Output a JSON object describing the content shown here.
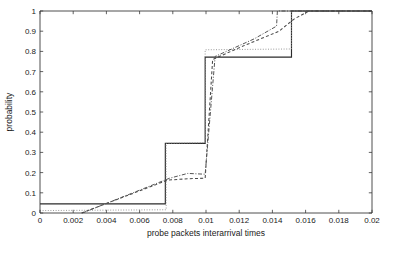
{
  "figure": {
    "background_color": "#ffffff",
    "plot_box": {
      "left": 40,
      "top": 11,
      "right": 372,
      "bottom": 213
    }
  },
  "chart_data": {
    "type": "line",
    "title": "",
    "subtitle": "",
    "xlabel": "probe packets interarrival times",
    "ylabel": "probability",
    "xlim": [
      0,
      0.02
    ],
    "ylim": [
      0,
      1
    ],
    "grid": false,
    "legend_position": "none",
    "xticks": [
      0,
      0.002,
      0.004,
      0.006,
      0.008,
      0.01,
      0.012,
      0.014,
      0.016,
      0.018,
      0.02
    ],
    "xticklabels": [
      "0",
      "0.002",
      "0.004",
      "0.006",
      "0.008",
      "0.01",
      "0.012",
      "0.014",
      "0.016",
      "0.018",
      "0.02"
    ],
    "yticks": [
      0,
      0.1,
      0.2,
      0.3,
      0.4,
      0.5,
      0.6,
      0.7,
      0.8,
      0.9,
      1
    ],
    "yticklabels": [
      "0",
      "0.1",
      "0.2",
      "0.3",
      "0.4",
      "0.5",
      "0.6",
      "0.7",
      "0.8",
      "0.9",
      "1"
    ],
    "series": [
      {
        "name": "empirical-cdf-solid",
        "style": "solid",
        "color": "#2b2b2b",
        "width": 1.15,
        "dasharray": "",
        "points": [
          [
            0.0,
            0.045
          ],
          [
            0.00755,
            0.045
          ],
          [
            0.00755,
            0.345
          ],
          [
            0.00995,
            0.345
          ],
          [
            0.00995,
            0.772
          ],
          [
            0.01515,
            0.772
          ],
          [
            0.01515,
            1.0
          ],
          [
            0.02,
            1.0
          ]
        ]
      },
      {
        "name": "model-cdf-dotted-light",
        "style": "dotted",
        "color": "#8f8f8f",
        "width": 0.9,
        "dasharray": "1,1.6",
        "points": [
          [
            0.0,
            0.012
          ],
          [
            0.0076,
            0.016
          ],
          [
            0.0076,
            0.345
          ],
          [
            0.00995,
            0.348
          ],
          [
            0.00995,
            0.808
          ],
          [
            0.01515,
            0.812
          ],
          [
            0.01515,
            1.0
          ],
          [
            0.02,
            1.0
          ]
        ]
      },
      {
        "name": "model-cdf-dashed",
        "style": "dashed",
        "color": "#4a4a4a",
        "width": 1.05,
        "dasharray": "3,2.2",
        "points": [
          [
            0.0025,
            0.0
          ],
          [
            0.0077,
            0.163
          ],
          [
            0.009,
            0.17
          ],
          [
            0.00995,
            0.172
          ],
          [
            0.0104,
            0.76
          ],
          [
            0.0121,
            0.822
          ],
          [
            0.0144,
            0.9
          ],
          [
            0.0153,
            0.96
          ],
          [
            0.0162,
            1.0
          ],
          [
            0.02,
            1.0
          ]
        ]
      },
      {
        "name": "model-cdf-dashdot",
        "style": "dashdot",
        "color": "#555555",
        "width": 1.0,
        "dasharray": "4,1.6,1,1.6",
        "points": [
          [
            0.00255,
            0.0
          ],
          [
            0.0078,
            0.172
          ],
          [
            0.0089,
            0.196
          ],
          [
            0.00995,
            0.192
          ],
          [
            0.01055,
            0.775
          ],
          [
            0.0129,
            0.862
          ],
          [
            0.01425,
            0.925
          ],
          [
            0.0143,
            1.0
          ],
          [
            0.02,
            1.0
          ]
        ]
      }
    ]
  }
}
